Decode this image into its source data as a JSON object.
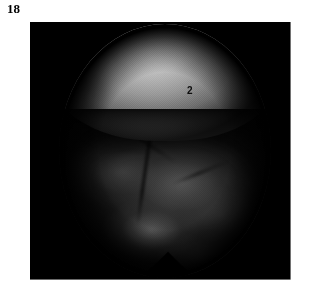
{
  "plate": {
    "figure_number": "18",
    "kind": "photographic-figure-plate",
    "background_color": "#ffffff"
  },
  "image_panel": {
    "background_color": "#000000",
    "x": 30,
    "y": 22,
    "width": 261,
    "height": 258
  },
  "photograph": {
    "modality": "endoscopic circular field",
    "field_shape": "circle",
    "field_background_color": "#000000",
    "regions": [
      {
        "name": "bright-dome",
        "description": "bright convex dome-shaped structure occupying the upper half of the circular field",
        "highlight_color": "#d4d4d4",
        "midtone_color": "#9a9a9a",
        "shadow_color": "#3f3f3f"
      },
      {
        "name": "lower-tissue",
        "description": "dark mottled tissue mass filling the lower half of the circular field",
        "highlight_color": "#686868",
        "midtone_color": "#3c3c3c",
        "shadow_color": "#0a0a0a"
      },
      {
        "name": "bottom-notch",
        "description": "V-shaped notch interrupting the bottom rim of the circular field",
        "color": "#000000"
      }
    ]
  },
  "annotations": [
    {
      "id": "label-2",
      "text": "2",
      "color": "#0d0d0d",
      "points_to": "bright-dome",
      "x": 157,
      "y": 64
    }
  ]
}
